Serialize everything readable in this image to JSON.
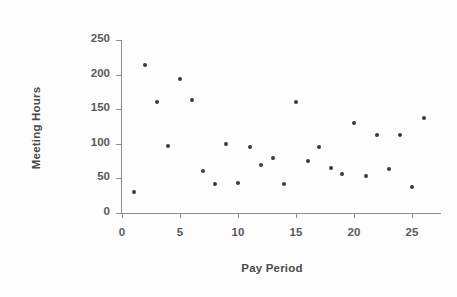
{
  "chart_data": {
    "type": "scatter",
    "title": "",
    "xlabel": "Pay Period",
    "ylabel": "Meeting Hours",
    "xlim": [
      0,
      27
    ],
    "ylim": [
      0,
      250
    ],
    "xticks": [
      0,
      5,
      10,
      15,
      20,
      25
    ],
    "yticks": [
      0,
      50,
      100,
      150,
      200,
      250
    ],
    "xtick_labels": [
      "0",
      "5",
      "10",
      "15",
      "20",
      "25"
    ],
    "ytick_labels": [
      "0",
      "50",
      "100",
      "150",
      "200",
      "250"
    ],
    "grid": false,
    "legend": null,
    "marker": "filled-circle",
    "marker_color": "#3a3a3a",
    "axis_color": "#8d8d8d",
    "x": [
      1,
      2,
      3,
      4,
      5,
      6,
      7,
      8,
      9,
      10,
      11,
      12,
      13,
      14,
      15,
      16,
      17,
      18,
      19,
      20,
      21,
      22,
      23,
      24,
      25,
      26
    ],
    "y": [
      30,
      214,
      161,
      97,
      194,
      163,
      60,
      42,
      100,
      44,
      96,
      69,
      80,
      42,
      160,
      75,
      95,
      65,
      57,
      130,
      54,
      113,
      64,
      113,
      38,
      138
    ],
    "points": [
      {
        "x": 1,
        "y": 30
      },
      {
        "x": 2,
        "y": 214
      },
      {
        "x": 3,
        "y": 161
      },
      {
        "x": 4,
        "y": 97
      },
      {
        "x": 5,
        "y": 194
      },
      {
        "x": 6,
        "y": 163
      },
      {
        "x": 7,
        "y": 60
      },
      {
        "x": 8,
        "y": 42
      },
      {
        "x": 9,
        "y": 100
      },
      {
        "x": 10,
        "y": 44
      },
      {
        "x": 11,
        "y": 96
      },
      {
        "x": 12,
        "y": 69
      },
      {
        "x": 13,
        "y": 80
      },
      {
        "x": 14,
        "y": 42
      },
      {
        "x": 15,
        "y": 160
      },
      {
        "x": 16,
        "y": 75
      },
      {
        "x": 17,
        "y": 95
      },
      {
        "x": 18,
        "y": 65
      },
      {
        "x": 19,
        "y": 57
      },
      {
        "x": 20,
        "y": 130
      },
      {
        "x": 21,
        "y": 54
      },
      {
        "x": 22,
        "y": 113
      },
      {
        "x": 23,
        "y": 64
      },
      {
        "x": 24,
        "y": 113
      },
      {
        "x": 25,
        "y": 38
      },
      {
        "x": 26,
        "y": 138
      }
    ]
  }
}
